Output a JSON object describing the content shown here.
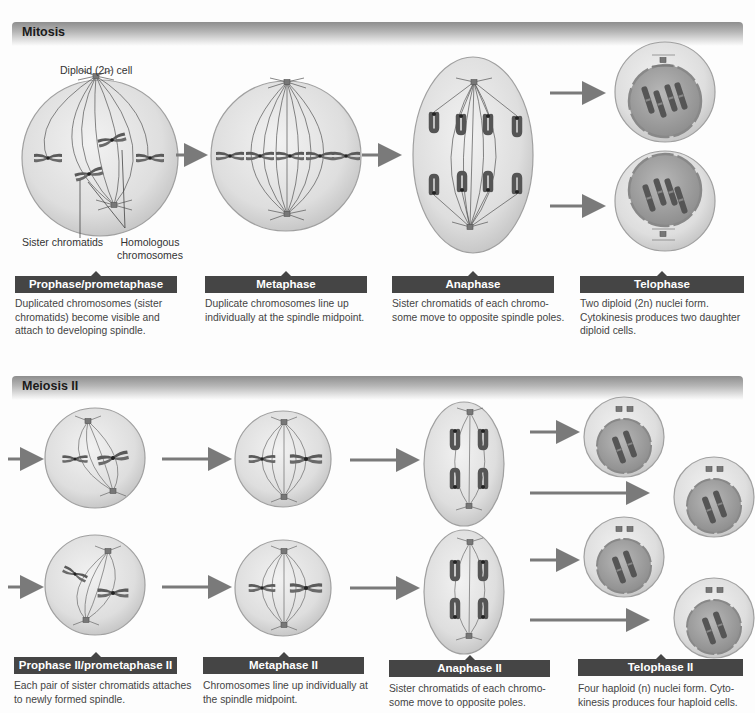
{
  "colors": {
    "label_bar": "#454545",
    "cell_fill": "#dcdcdc",
    "cell_stroke": "#9a9a9a",
    "chromosome": "#5a5a5a",
    "arrow": "#7a7a7a",
    "nucleus": "#9e9e9e"
  },
  "mitosis": {
    "title": "Mitosis",
    "annotations": {
      "diploid_cell": "Diploid (2n) cell",
      "sister_chromatids": "Sister chromatids",
      "homologous_line1": "Homologous",
      "homologous_line2": "chromosomes"
    },
    "stages": [
      {
        "label": "Prophase/prometaphase",
        "lines": [
          "Duplicated chromosomes (sister",
          "chromatids) become visible and",
          "attach to developing spindle."
        ]
      },
      {
        "label": "Metaphase",
        "lines": [
          "Duplicate chromosomes line up",
          "individually at the spindle midpoint."
        ]
      },
      {
        "label": "Anaphase",
        "lines": [
          "Sister chromatids of each chromo-",
          "some move to opposite spindle poles."
        ]
      },
      {
        "label": "Telophase",
        "lines": [
          "Two diploid (2n) nuclei form.",
          "Cytokinesis produces two daughter",
          "diploid cells."
        ]
      }
    ]
  },
  "meiosis2": {
    "title": "Meiosis II",
    "stages": [
      {
        "label": "Prophase II/prometaphase II",
        "lines": [
          "Each pair of sister chromatids attaches",
          "to newly formed spindle."
        ]
      },
      {
        "label": "Metaphase II",
        "lines": [
          "Chromosomes line up individually at",
          "the spindle midpoint."
        ]
      },
      {
        "label": "Anaphase II",
        "lines": [
          "Sister chromatids of each chromo-",
          "some move to opposite poles."
        ]
      },
      {
        "label": "Telophase II",
        "lines": [
          "Four haploid (n) nuclei form. Cyto-",
          "kinesis produces four haploid cells."
        ]
      }
    ]
  }
}
